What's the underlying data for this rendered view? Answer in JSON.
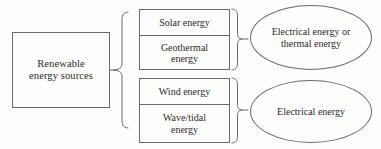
{
  "diagram": {
    "type": "flow-diagram",
    "colors": {
      "background": "#fdfdfb",
      "stroke": "#6a6a6a",
      "text": "#2b2b2b"
    },
    "source": {
      "label": "Renewable\nenergy sources",
      "line1": "Renewable",
      "line2": "energy sources"
    },
    "groups": [
      {
        "id": "upper",
        "items": [
          {
            "label": "Solar energy"
          },
          {
            "label": "Geothermal\nenergy",
            "line1": "Geothermal",
            "line2": "energy"
          }
        ],
        "output": {
          "label": "Electrical energy or\nthermal energy",
          "line1": "Electrical energy or",
          "line2": "thermal energy"
        }
      },
      {
        "id": "lower",
        "items": [
          {
            "label": "Wind energy"
          },
          {
            "label": "Wave/tidal\nenergy",
            "line1": "Wave/tidal",
            "line2": "energy"
          }
        ],
        "output": {
          "label": "Electrical energy",
          "line1": "Electrical energy",
          "line2": ""
        }
      }
    ],
    "connectors": [
      {
        "name": "source-to-groups-brace",
        "shape": "curly-brace-left"
      },
      {
        "name": "upper-group-to-output-brace",
        "shape": "curly-brace-right"
      },
      {
        "name": "lower-group-to-output-brace",
        "shape": "curly-brace-right"
      }
    ]
  }
}
